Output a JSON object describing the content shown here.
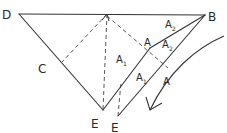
{
  "diagram": {
    "type": "geometric-sketch",
    "style": "hand-drawn",
    "colors": {
      "line": "#333333",
      "background": "#ffffff"
    },
    "points": [
      {
        "id": "D",
        "label": "D",
        "x": 19,
        "y": 14,
        "label_x": 3,
        "label_y": 19
      },
      {
        "id": "B",
        "label": "B",
        "x": 205,
        "y": 15,
        "label_x": 208,
        "label_y": 21
      },
      {
        "id": "C",
        "label": "C",
        "x": 62,
        "y": 62,
        "label_x": 40,
        "label_y": 73
      },
      {
        "id": "A_top",
        "label": "A",
        "x": 150,
        "y": 48,
        "label_x": 145,
        "label_y": 46
      },
      {
        "id": "A_low",
        "label": "A",
        "x": 168,
        "y": 80,
        "label_x": 165,
        "label_y": 85
      },
      {
        "id": "E1",
        "label": "E",
        "x": 103,
        "y": 110,
        "label_x": 92,
        "label_y": 127
      },
      {
        "id": "E2",
        "label": "E",
        "x": 118,
        "y": 116,
        "label_x": 111,
        "label_y": 132
      },
      {
        "id": "Apex",
        "label": "",
        "x": 107,
        "y": 14
      }
    ],
    "region_labels": [
      {
        "text": "A",
        "sub": "1",
        "x": 116,
        "y": 63
      },
      {
        "text": "A",
        "sub": "1",
        "x": 137,
        "y": 82
      },
      {
        "text": "A",
        "sub": "2",
        "x": 166,
        "y": 28
      },
      {
        "text": "A",
        "sub": "2",
        "x": 163,
        "y": 48
      }
    ],
    "solid_lines": [
      {
        "name": "line-D-B",
        "from": "D",
        "to": "B"
      },
      {
        "name": "line-D-E1",
        "from": "D",
        "to": "E1"
      },
      {
        "name": "line-E1-A",
        "from": "E1",
        "to": "A_top"
      },
      {
        "name": "line-A-B",
        "from": "A_top",
        "to": "B"
      },
      {
        "name": "line-E2-B",
        "from": "E2",
        "to": "B"
      },
      {
        "name": "line-E1-E2",
        "from": "E1",
        "to": "E2"
      }
    ],
    "dashed_lines": [
      {
        "name": "dashed-apex-E1",
        "from": "Apex",
        "to": "E1"
      },
      {
        "name": "dashed-apex-C",
        "from": "Apex",
        "to": "C"
      },
      {
        "name": "dashed-apex-right",
        "from": "Apex",
        "to_xy": [
          168,
          68
        ]
      },
      {
        "name": "dashed-E2-up",
        "from": "E2",
        "to_xy": [
          121,
          80
        ]
      }
    ],
    "arrow": {
      "name": "fold-direction-arrow",
      "description": "curved arrow sweeping down-left",
      "path_start": [
        224,
        36
      ],
      "path_end": [
        150,
        110
      ]
    }
  }
}
